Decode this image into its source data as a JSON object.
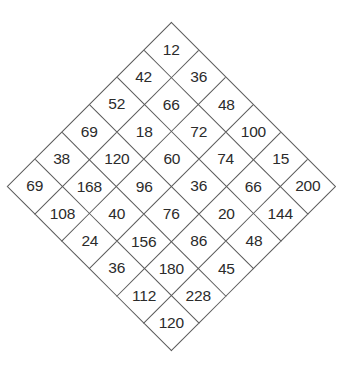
{
  "figure": {
    "name": "diamond-number-grid",
    "shape": "rotated-square-grid",
    "rows": 6,
    "columns": 6,
    "background_color": "#ffffff",
    "line_color": "#5a5a5a",
    "text_color": "#2b2b2b"
  },
  "chart_data": {
    "type": "table",
    "title": "",
    "xlabel": "",
    "ylabel": "",
    "orientation": "rotated-45-degrees",
    "grid": true,
    "rows": 6,
    "columns": 6,
    "cells": [
      [
        12,
        36,
        48,
        100,
        15,
        200
      ],
      [
        42,
        66,
        72,
        74,
        66,
        144
      ],
      [
        52,
        18,
        60,
        36,
        20,
        48
      ],
      [
        69,
        120,
        96,
        76,
        86,
        45
      ],
      [
        38,
        168,
        40,
        156,
        180,
        228
      ],
      [
        69,
        108,
        24,
        36,
        112,
        120
      ]
    ],
    "diagonal_rows": [
      {
        "index": 1,
        "values": [
          12
        ]
      },
      {
        "index": 2,
        "values": [
          42,
          36
        ]
      },
      {
        "index": 3,
        "values": [
          52,
          66,
          48
        ]
      },
      {
        "index": 4,
        "values": [
          69,
          18,
          72,
          100
        ]
      },
      {
        "index": 5,
        "values": [
          38,
          120,
          60,
          74,
          15
        ]
      },
      {
        "index": 6,
        "values": [
          69,
          168,
          96,
          36,
          66,
          200
        ]
      },
      {
        "index": 7,
        "values": [
          108,
          40,
          76,
          20,
          144
        ]
      },
      {
        "index": 8,
        "values": [
          24,
          156,
          86,
          48
        ]
      },
      {
        "index": 9,
        "values": [
          36,
          180,
          45
        ]
      },
      {
        "index": 10,
        "values": [
          112,
          228
        ]
      },
      {
        "index": 11,
        "values": [
          120
        ]
      }
    ],
    "flat_values": [
      12,
      36,
      48,
      100,
      15,
      200,
      42,
      66,
      72,
      74,
      66,
      144,
      52,
      18,
      60,
      36,
      20,
      48,
      69,
      120,
      96,
      76,
      86,
      45,
      38,
      168,
      40,
      156,
      180,
      228,
      69,
      108,
      24,
      36,
      112,
      120
    ]
  }
}
